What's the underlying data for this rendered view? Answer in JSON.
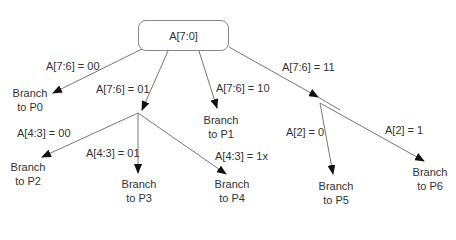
{
  "root": {
    "label": "A[7:0]"
  },
  "edges": [
    {
      "id": "p0",
      "label": "A[7:6] = 00"
    },
    {
      "id": "n1",
      "label": "A[7:6] = 01"
    },
    {
      "id": "p1",
      "label": "A[7:6] = 10"
    },
    {
      "id": "n2",
      "label": "A[7:6] = 11"
    },
    {
      "id": "p2",
      "label": "A[4:3] = 00"
    },
    {
      "id": "p3",
      "label": "A[4:3] = 01"
    },
    {
      "id": "p4",
      "label": "A[4:3] = 1x"
    },
    {
      "id": "p5",
      "label": "A[2] = 0"
    },
    {
      "id": "p6",
      "label": "A[2] = 1"
    }
  ],
  "leaves": [
    {
      "line1": "Branch",
      "line2": "to P0"
    },
    {
      "line1": "Branch",
      "line2": "to P1"
    },
    {
      "line1": "Branch",
      "line2": "to P2"
    },
    {
      "line1": "Branch",
      "line2": "to P3"
    },
    {
      "line1": "Branch",
      "line2": "to P4"
    },
    {
      "line1": "Branch",
      "line2": "to P5"
    },
    {
      "line1": "Branch",
      "line2": "to P6"
    }
  ]
}
